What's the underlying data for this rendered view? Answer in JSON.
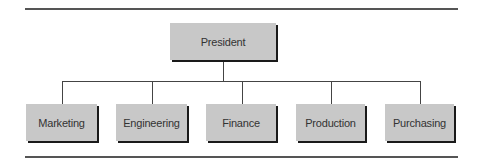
{
  "diagram": {
    "type": "org-chart",
    "root": {
      "label": "President"
    },
    "children": [
      {
        "label": "Marketing"
      },
      {
        "label": "Engineering"
      },
      {
        "label": "Finance"
      },
      {
        "label": "Production"
      },
      {
        "label": "Purchasing"
      }
    ],
    "colors": {
      "box_fill": "#c8c8c8",
      "box_shadow": "#1a1a1a",
      "connector": "#444444",
      "rule": "#555555",
      "text": "#333333"
    }
  }
}
